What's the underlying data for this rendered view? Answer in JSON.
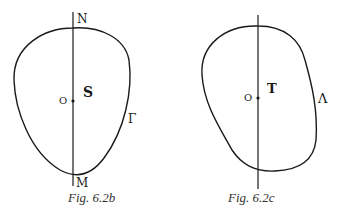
{
  "figures": [
    {
      "id": "fig-6-2b",
      "caption": "Fig. 6.2b",
      "top_label": "N",
      "bottom_label": "M",
      "origin_label": "O",
      "region_label": "S",
      "curve_label": "Γ"
    },
    {
      "id": "fig-6-2c",
      "caption": "Fig. 6.2c",
      "origin_label": "O",
      "region_label": "T",
      "curve_label": "Λ"
    }
  ],
  "colors": {
    "stroke": "#1a1a1a",
    "background": "#ffffff"
  }
}
